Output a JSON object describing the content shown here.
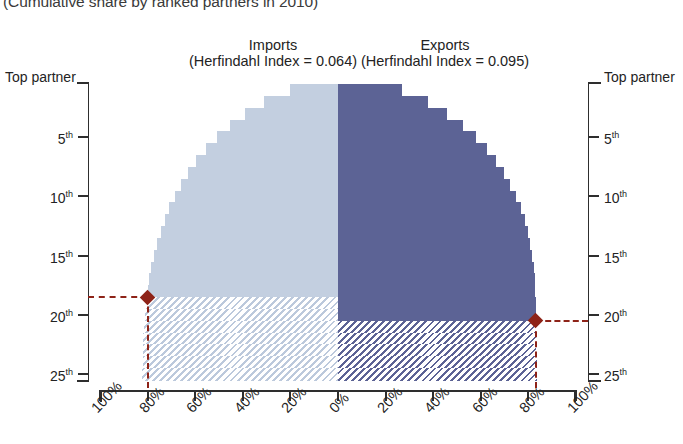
{
  "subtitle": "(Cumulative share by ranked partners in 2010)",
  "panels": {
    "left": {
      "title": "Imports",
      "subtitle": "(Herfindahl Index = 0.064)",
      "fill_color": "#c3cfe0"
    },
    "right": {
      "title": "Exports",
      "subtitle": "(Herfindahl Index = 0.095)",
      "fill_color": "#5c6395"
    }
  },
  "axes": {
    "y_title_left": "Top partner",
    "y_title_right": "Top partner",
    "y_ticks": [
      "5",
      "10",
      "15",
      "20",
      "25"
    ],
    "y_tick_suffix": "th",
    "x_ticks_left": [
      "100%",
      "80%",
      "60%",
      "40%",
      "20%",
      "0%"
    ],
    "x_ticks_right": [
      "20%",
      "40%",
      "60%",
      "80%",
      "100%"
    ]
  },
  "markers": {
    "color": "#8e2318",
    "imports_rank": 18,
    "imports_share_pct": 80,
    "exports_rank": 20,
    "exports_share_pct": 83
  },
  "chart_data": {
    "type": "bar",
    "title": "(Cumulative share by ranked partners in 2010)",
    "orientation": "horizontal-butterfly",
    "xlabel": "Cumulative share (%)",
    "ylabel": "Partner rank",
    "xlim": [
      -100,
      100
    ],
    "ylim": [
      1,
      25
    ],
    "grid": false,
    "legend": [
      "Imports (Herfindahl Index = 0.064)",
      "Exports (Herfindahl Index = 0.095)"
    ],
    "categories": [
      1,
      2,
      3,
      4,
      5,
      6,
      7,
      8,
      9,
      10,
      11,
      12,
      13,
      14,
      15,
      16,
      17,
      18,
      19,
      20,
      21,
      22,
      23,
      24,
      25
    ],
    "series": [
      {
        "name": "Imports",
        "side": "left",
        "color": "#c3cfe0",
        "herfindahl_index": 0.064,
        "solid_through_rank": 18,
        "values": [
          20.0,
          31.0,
          39.0,
          45.5,
          51.0,
          55.5,
          59.5,
          63.0,
          66.0,
          68.5,
          70.8,
          72.8,
          74.5,
          76.0,
          77.3,
          78.4,
          79.3,
          80.0,
          80.6,
          81.1,
          81.5,
          81.8,
          82.0,
          82.1,
          82.2
        ]
      },
      {
        "name": "Exports",
        "side": "right",
        "color": "#5c6395",
        "herfindahl_index": 0.095,
        "solid_through_rank": 20,
        "values": [
          27.0,
          38.0,
          46.0,
          52.5,
          58.0,
          62.5,
          66.3,
          69.6,
          72.4,
          74.8,
          76.8,
          78.4,
          79.7,
          80.8,
          81.6,
          82.2,
          82.6,
          82.9,
          83.1,
          83.2,
          83.3,
          83.35,
          83.4,
          83.45,
          83.5
        ]
      }
    ],
    "annotations": [
      {
        "label": "Imports threshold",
        "rank": 18,
        "share_pct": 80,
        "side": "left",
        "color": "#8e2318"
      },
      {
        "label": "Exports threshold",
        "rank": 20,
        "share_pct": 83,
        "side": "right",
        "color": "#8e2318"
      }
    ]
  }
}
